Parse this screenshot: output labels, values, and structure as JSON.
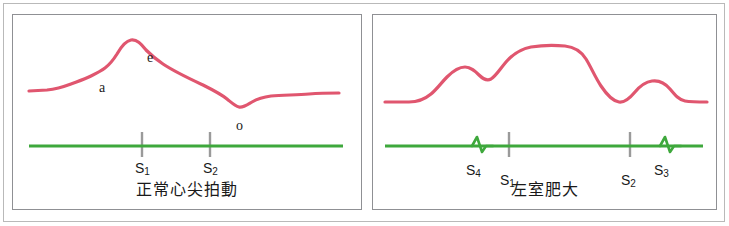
{
  "figure": {
    "type": "medical-waveform-diagram",
    "colors": {
      "trace_pink": "#e0566f",
      "baseline_green": "#3ea83c",
      "tick_gray": "#9a9a9a",
      "panel_border": "#8f9094",
      "outer_border": "#b9b9b9",
      "text": "#1a1a1a",
      "background": "#ffffff"
    }
  },
  "panels": [
    {
      "id": "normal",
      "caption": "正常心尖拍動",
      "wave_labels": [
        {
          "text": "a",
          "x": 86,
          "y": 66
        },
        {
          "text": "e",
          "x": 134,
          "y": 36
        },
        {
          "text": "o",
          "x": 223,
          "y": 104
        }
      ],
      "heart_sounds": [
        {
          "text": "S",
          "sub": "1",
          "x": 122,
          "y": 146,
          "marker": "tick"
        },
        {
          "text": "S",
          "sub": "2",
          "x": 190,
          "y": 146,
          "marker": "tick"
        }
      ],
      "baseline_y": 131,
      "tick_marks": [
        {
          "x": 129,
          "y1": 117,
          "y2": 142
        },
        {
          "x": 197,
          "y1": 117,
          "y2": 142
        }
      ],
      "trace_path": "M 16 76 L 34 75 C 44 74 50 72 58 69 C 66 66 72 64 78 61 C 84 58 88 56 92 53 C 96 50 99 47 104 39 C 108 32 112 26 118 25 C 124 24 128 29 133 35 C 139 41 144 45 150 49 C 162 57 175 63 190 70 C 200 75 208 79 214 84 C 219 88 222 91 226 92 C 230 93 234 90 239 87 C 244 84 250 82 258 81 C 270 80 284 80 296 79 C 308 78 318 78 326 78"
    },
    {
      "id": "lvh",
      "caption": "左室肥大",
      "wave_labels": [],
      "heart_sounds": [
        {
          "text": "S",
          "sub": "4",
          "x": 93,
          "y": 148,
          "marker": "zigzag"
        },
        {
          "text": "S",
          "sub": "1",
          "x": 127,
          "y": 158,
          "marker": "tick"
        },
        {
          "text": "S",
          "sub": "2",
          "x": 248,
          "y": 158,
          "marker": "tick"
        },
        {
          "text": "S",
          "sub": "3",
          "x": 281,
          "y": 148,
          "marker": "zigzag"
        }
      ],
      "baseline_y": 131,
      "tick_marks": [
        {
          "x": 136,
          "y1": 117,
          "y2": 142
        },
        {
          "x": 257,
          "y1": 117,
          "y2": 142
        }
      ],
      "zigzags": [
        {
          "x": 108,
          "direction": "up-down"
        },
        {
          "x": 296,
          "direction": "up-down"
        }
      ],
      "trace_path": "M 12 87 L 36 87 C 46 87 52 84 58 79 C 64 74 68 68 74 62 C 80 56 86 52 92 52 C 98 52 102 56 106 60 C 110 64 114 66 118 64 C 123 61 127 54 133 47 C 140 39 148 34 158 32 C 170 30 182 30 192 31 C 202 32 208 36 213 44 C 218 52 222 62 228 71 C 234 80 240 86 246 87 C 252 88 257 83 262 77 C 267 71 272 67 279 66 C 286 65 292 68 297 74 C 302 80 306 85 312 86 C 318 87 326 87 334 87"
    }
  ]
}
